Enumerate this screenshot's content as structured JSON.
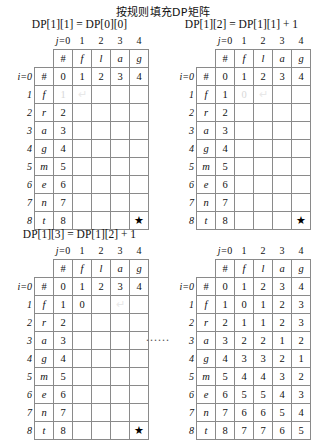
{
  "main_title": "按规则填充DP矩阵",
  "ellipsis": "......",
  "axis": {
    "col_prefix": "j=",
    "row_prefix": "i=",
    "col_indices": [
      "0",
      "1",
      "2",
      "3",
      "4"
    ],
    "row_indices": [
      "0",
      "1",
      "2",
      "3",
      "4",
      "5",
      "6",
      "7",
      "8"
    ]
  },
  "col_headers": [
    "#",
    "f",
    "l",
    "a",
    "g"
  ],
  "row_headers": [
    "#",
    "f",
    "r",
    "a",
    "g",
    "m",
    "e",
    "n",
    "t"
  ],
  "star": "★",
  "arrow": "↵",
  "panels": [
    {
      "id": "panel-1",
      "title": "DP[1][1] = DP[0][0]",
      "rows": [
        [
          "0",
          "1",
          "2",
          "3",
          "4"
        ],
        [
          "1",
          "",
          "",
          "",
          ""
        ],
        [
          "2",
          "",
          "",
          "",
          ""
        ],
        [
          "3",
          "",
          "",
          "",
          ""
        ],
        [
          "4",
          "",
          "",
          "",
          ""
        ],
        [
          "5",
          "",
          "",
          "",
          ""
        ],
        [
          "6",
          "",
          "",
          "",
          ""
        ],
        [
          "7",
          "",
          "",
          "",
          ""
        ],
        [
          "8",
          "",
          "",
          "",
          ""
        ]
      ],
      "highlight_dark": [
        [
          0,
          0
        ],
        [
          0,
          1
        ]
      ],
      "highlight_darker": [
        [
          1,
          0
        ],
        [
          1,
          1
        ]
      ],
      "arrow_cell": [
        1,
        1
      ],
      "star_cell": [
        8,
        4
      ]
    },
    {
      "id": "panel-2",
      "title": "DP[1][2] = DP[1][1] + 1",
      "rows": [
        [
          "0",
          "1",
          "2",
          "3",
          "4"
        ],
        [
          "1",
          "0",
          "",
          "",
          ""
        ],
        [
          "2",
          "",
          "",
          "",
          ""
        ],
        [
          "3",
          "",
          "",
          "",
          ""
        ],
        [
          "4",
          "",
          "",
          "",
          ""
        ],
        [
          "5",
          "",
          "",
          "",
          ""
        ],
        [
          "6",
          "",
          "",
          "",
          ""
        ],
        [
          "7",
          "",
          "",
          "",
          ""
        ],
        [
          "8",
          "",
          "",
          "",
          ""
        ]
      ],
      "highlight_dark": [
        [
          0,
          1
        ],
        [
          0,
          2
        ]
      ],
      "highlight_darker": [
        [
          1,
          1
        ],
        [
          1,
          2
        ]
      ],
      "arrow_cell": [
        1,
        2
      ],
      "star_cell": [
        8,
        4
      ]
    },
    {
      "id": "panel-3",
      "title": "DP[1][3] = DP[1][2] + 1",
      "rows": [
        [
          "0",
          "1",
          "2",
          "3",
          "4"
        ],
        [
          "1",
          "0",
          "",
          "",
          ""
        ],
        [
          "2",
          "",
          "",
          "",
          ""
        ],
        [
          "3",
          "",
          "",
          "",
          ""
        ],
        [
          "4",
          "",
          "",
          "",
          ""
        ],
        [
          "5",
          "",
          "",
          "",
          ""
        ],
        [
          "6",
          "",
          "",
          "",
          ""
        ],
        [
          "7",
          "",
          "",
          "",
          ""
        ],
        [
          "8",
          "",
          "",
          "",
          ""
        ]
      ],
      "highlight_dark": [
        [
          0,
          2
        ],
        [
          0,
          3
        ]
      ],
      "highlight_darker": [
        [
          1,
          2
        ],
        [
          1,
          3
        ]
      ],
      "arrow_cell": [
        1,
        3
      ],
      "star_cell": [
        8,
        4
      ]
    },
    {
      "id": "panel-4",
      "title": "",
      "rows": [
        [
          "0",
          "1",
          "2",
          "3",
          "4"
        ],
        [
          "1",
          "0",
          "1",
          "2",
          "3"
        ],
        [
          "2",
          "1",
          "1",
          "2",
          "3"
        ],
        [
          "3",
          "2",
          "2",
          "1",
          "2"
        ],
        [
          "4",
          "3",
          "3",
          "2",
          "1"
        ],
        [
          "5",
          "4",
          "4",
          "3",
          "2"
        ],
        [
          "6",
          "5",
          "5",
          "4",
          "3"
        ],
        [
          "7",
          "6",
          "6",
          "5",
          "4"
        ],
        [
          "8",
          "7",
          "7",
          "6",
          "5"
        ]
      ],
      "highlight_dark": [],
      "highlight_darker": [],
      "arrow_cell": null,
      "star_cell": null
    }
  ]
}
